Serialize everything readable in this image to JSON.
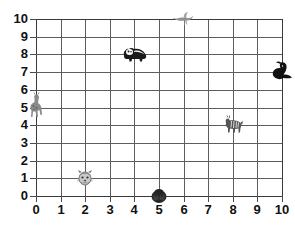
{
  "chart": {
    "title": "",
    "type": "scatter"
  },
  "axes": {
    "x_ticks": [
      "0",
      "1",
      "2",
      "3",
      "4",
      "5",
      "6",
      "7",
      "8",
      "9",
      "10"
    ],
    "y_ticks": [
      "0",
      "1",
      "2",
      "3",
      "4",
      "5",
      "6",
      "7",
      "8",
      "9",
      "10"
    ],
    "xlabel": "",
    "ylabel": ""
  },
  "colors": {
    "grid": "#5d5d5d",
    "grid_edge": "#3a3a3a",
    "text": "#111111",
    "background": "#ffffff",
    "panda": "#1a1a1a",
    "giraffe": "#8a8a8a",
    "tiger": "#777777",
    "gorilla": "#2b2b2b",
    "bird": "#909090",
    "zebra": "#555555",
    "seal": "#111111"
  },
  "chart_data": {
    "type": "scatter",
    "title": "",
    "xlabel": "",
    "ylabel": "",
    "xlim": [
      0,
      10
    ],
    "ylim": [
      0,
      10
    ],
    "grid": true,
    "legend": "none",
    "x_ticks": [
      0,
      1,
      2,
      3,
      4,
      5,
      6,
      7,
      8,
      9,
      10
    ],
    "y_ticks": [
      0,
      1,
      2,
      3,
      4,
      5,
      6,
      7,
      8,
      9,
      10
    ],
    "points": [
      {
        "label": "giraffe",
        "icon": "giraffe-icon",
        "x": 0,
        "y": 5
      },
      {
        "label": "tiger",
        "icon": "tiger-face-icon",
        "x": 2,
        "y": 1
      },
      {
        "label": "panda",
        "icon": "panda-icon",
        "x": 4,
        "y": 8
      },
      {
        "label": "gorilla",
        "icon": "gorilla-icon",
        "x": 5,
        "y": 0
      },
      {
        "label": "bird",
        "icon": "bird-icon",
        "x": 6,
        "y": 10
      },
      {
        "label": "zebra",
        "icon": "zebra-icon",
        "x": 8,
        "y": 4
      },
      {
        "label": "seal",
        "icon": "seal-icon",
        "x": 10,
        "y": 7
      }
    ]
  }
}
